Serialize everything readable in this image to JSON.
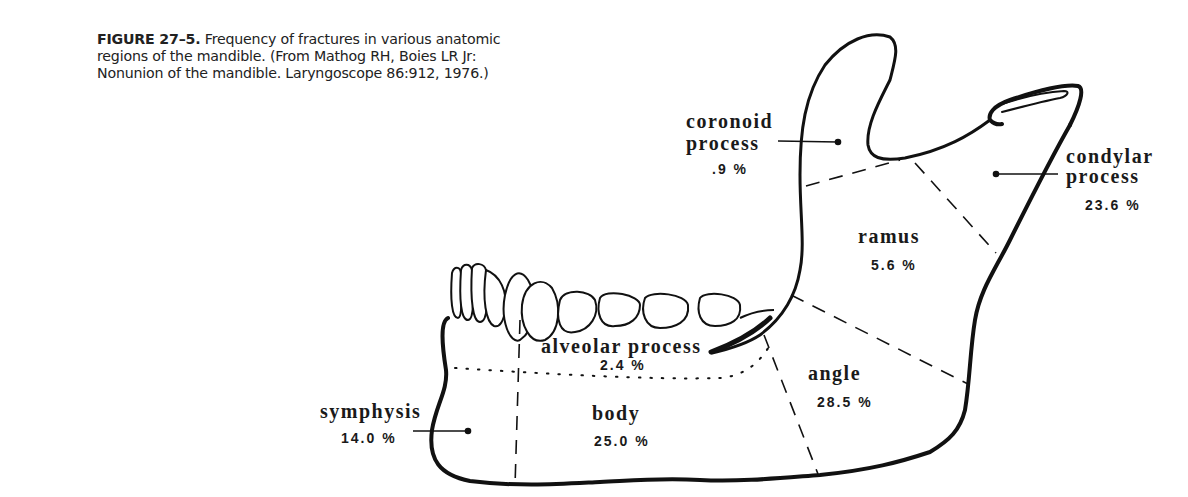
{
  "caption": {
    "label": "FIGURE 27–5.",
    "text": " Frequency of fractures in various anatomic regions of the mandible. (From Mathog RH, Boies LR Jr: Nonunion of the mandible. Laryngoscope 86:912, 1976.)"
  },
  "regions": {
    "coronoid": {
      "name_line1": "coronoid",
      "name_line2": "process",
      "value": ".9 %"
    },
    "condylar": {
      "name_line1": "condylar",
      "name_line2": "process",
      "value": "23.6 %"
    },
    "ramus": {
      "name": "ramus",
      "value": "5.6 %"
    },
    "alveolar": {
      "name": "alveolar process",
      "value": "2.4 %"
    },
    "angle": {
      "name": "angle",
      "value": "28.5 %"
    },
    "symphysis": {
      "name": "symphysis",
      "value": "14.0 %"
    },
    "body": {
      "name": "body",
      "value": "25.0 %"
    }
  },
  "colors": {
    "line": "#111111",
    "text": "#1a1a1a",
    "background": "#ffffff"
  }
}
